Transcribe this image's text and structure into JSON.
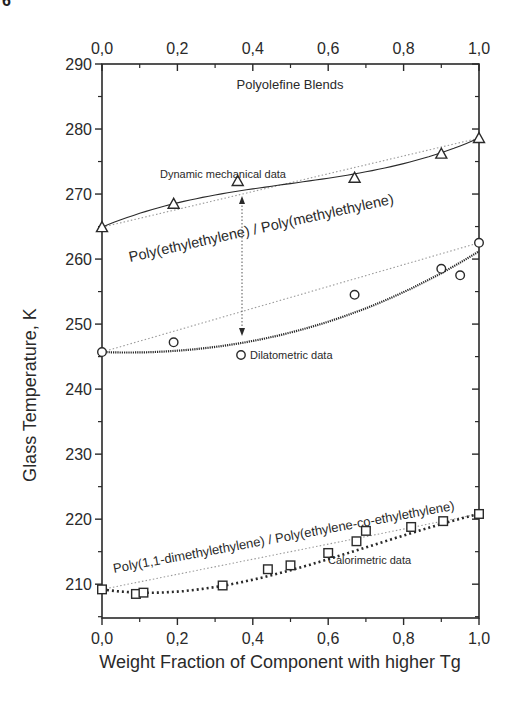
{
  "figure_number_fragment": "6",
  "chart_data": {
    "type": "scatter",
    "title": "Polyolefine Blends",
    "xlabel": "Weight Fraction of Component with higher Tg",
    "ylabel": "Glass Temperature, K",
    "xlim": [
      0.0,
      1.0
    ],
    "ylim": [
      204.8,
      290
    ],
    "x_ticks": [
      "0,0",
      "0,2",
      "0,4",
      "0,6",
      "0,8",
      "1,0"
    ],
    "x_tick_values": [
      0.0,
      0.2,
      0.4,
      0.6,
      0.8,
      1.0
    ],
    "y_ticks": [
      "210",
      "220",
      "230",
      "240",
      "250",
      "260",
      "270",
      "280",
      "290"
    ],
    "y_tick_values": [
      210,
      220,
      230,
      240,
      250,
      260,
      270,
      280,
      290
    ],
    "top_axis_duplicate": true,
    "grid": false,
    "series": [
      {
        "name": "Dynamic mechanical data",
        "blend": "Poly(ethylethylene) / Poly(methylethylene)",
        "marker": "triangle",
        "fit_line": "solid",
        "x": [
          0.0,
          0.19,
          0.36,
          0.67,
          0.9,
          1.0
        ],
        "y": [
          264.9,
          268.5,
          272.0,
          272.5,
          276.2,
          278.6
        ]
      },
      {
        "name": "Dilatometric data",
        "blend": "Poly(ethylethylene) / Poly(methylethylene)",
        "marker": "circle",
        "fit_line": "dense-dotted",
        "x": [
          0.0,
          0.19,
          0.67,
          0.9,
          0.95,
          1.0
        ],
        "y": [
          245.7,
          247.2,
          254.5,
          258.5,
          257.5,
          262.5
        ]
      },
      {
        "name": "Calorimetric data",
        "blend": "Poly(1,1-dimethylethylene) / Poly(ethylene-co-ethylethylene)",
        "marker": "square",
        "fit_line": "bold-dotted",
        "x": [
          0.0,
          0.09,
          0.11,
          0.32,
          0.44,
          0.5,
          0.6,
          0.675,
          0.7,
          0.82,
          0.905,
          1.0
        ],
        "y": [
          209.2,
          208.5,
          208.7,
          209.8,
          212.3,
          212.9,
          214.8,
          216.6,
          218.2,
          218.8,
          219.7,
          220.8
        ]
      }
    ],
    "linear_reference_lines": [
      {
        "from": [
          0.0,
          264.9
        ],
        "to": [
          1.0,
          278.6
        ],
        "style": "light-dotted"
      },
      {
        "from": [
          0.0,
          245.7
        ],
        "to": [
          1.0,
          262.5
        ],
        "style": "light-dotted"
      },
      {
        "from": [
          0.0,
          209.2
        ],
        "to": [
          1.0,
          220.8
        ],
        "style": "light-dotted"
      }
    ],
    "annotations": [
      {
        "text": "Polyolefine Blends",
        "x": 0.5,
        "y": 286.8
      },
      {
        "text": "Dynamic mechanical data",
        "x": 0.15,
        "y": 273.8
      },
      {
        "text": "Poly(ethylethylene) / Poly(methylethylene)",
        "rotated": true
      },
      {
        "text": "Dilatometric data",
        "x": 0.38,
        "y": 245.4
      },
      {
        "text": "Poly(1,1-dimethylethylene) / Poly(ethylene-co-ethylethylene)",
        "rotated": true
      },
      {
        "text": "Calorimetric data",
        "x": 0.61,
        "y": 212.3
      },
      {
        "text": "double-headed arrow",
        "x": 0.37,
        "y_range": [
          247.5,
          270.5
        ]
      }
    ]
  },
  "labels": {
    "title": "Polyolefine Blends",
    "xlabel": "Weight Fraction of Component with higher Tg",
    "ylabel": "Glass Temperature, K",
    "annot_dynamic": "Dynamic mechanical data",
    "annot_blend1": "Poly(ethylethylene) / Poly(methylethylene)",
    "annot_dilato": "Dilatometric data",
    "annot_blend2": "Poly(1,1-dimethylethylene) / Poly(ethylene-co-ethylethylene)",
    "annot_calori": "Calorimetric data"
  },
  "colors": {
    "ink": "#2a2a2a",
    "reference_line": "#9a9a9a",
    "background": "#ffffff"
  }
}
